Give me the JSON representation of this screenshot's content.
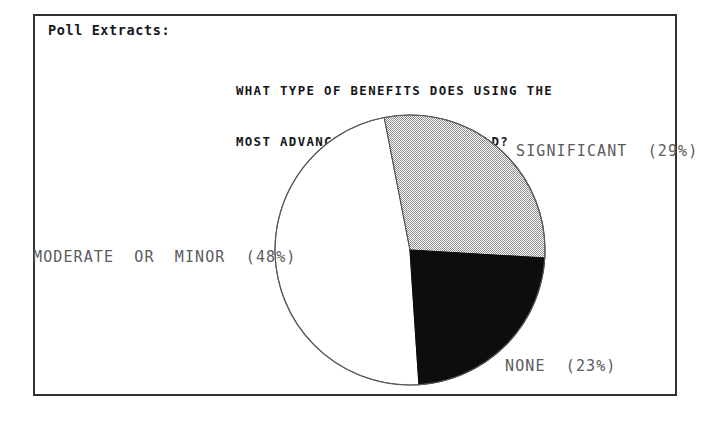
{
  "page": {
    "caption": "Poll Extracts:",
    "title_line_1": "WHAT TYPE OF BENEFITS DOES USING THE",
    "title_line_2": "MOST ADVANCED TECHNOLOGY YIELD?"
  },
  "labels": {
    "significant": "SIGNIFICANT  (29%)",
    "moderate": "MODERATE  OR  MINOR  (48%)",
    "none": "NONE  (23%)"
  },
  "chart_data": {
    "type": "pie",
    "title": "WHAT TYPE OF BENEFITS DOES USING THE MOST ADVANCED TECHNOLOGY YIELD?",
    "categories": [
      "SIGNIFICANT",
      "NONE",
      "MODERATE OR MINOR"
    ],
    "values": [
      29,
      23,
      48
    ],
    "value_unit": "%",
    "labels": [
      "SIGNIFICANT  (29%)",
      "NONE  (23%)",
      "MODERATE  OR  MINOR  (48%)"
    ],
    "slice_fills": [
      "#b4b4b4",
      "#0d0d0d",
      "#ffffff"
    ],
    "slice_fill_names": [
      "gray-dither-hatch",
      "solid-black",
      "solid-white"
    ],
    "start_angle_deg": -11,
    "direction": "clockwise",
    "legend": "none",
    "legend_position": "outside-labels",
    "grid": false,
    "outline_color": "#5a5a5c",
    "center_x": 410,
    "center_y": 250,
    "radius": 135
  },
  "style": {
    "frame_color": "#30302e",
    "text_color": "#18181a",
    "label_color": "#5b5b5e",
    "background": "#ffffff"
  }
}
